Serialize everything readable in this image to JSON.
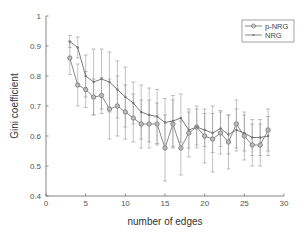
{
  "chart_data": {
    "type": "line",
    "title": "",
    "xlabel": "number of edges",
    "ylabel": "Gini coefficient",
    "xlim": [
      0,
      30
    ],
    "ylim": [
      0.4,
      1
    ],
    "xticks": [
      0,
      5,
      10,
      15,
      20,
      25,
      30
    ],
    "yticks": [
      0.4,
      0.5,
      0.6,
      0.7,
      0.8,
      0.9,
      1
    ],
    "grid": false,
    "legend_position": "upper right",
    "x": [
      3,
      4,
      5,
      6,
      7,
      8,
      9,
      10,
      11,
      12,
      13,
      14,
      15,
      16,
      17,
      18,
      19,
      20,
      21,
      22,
      23,
      24,
      25,
      26,
      27,
      28
    ],
    "series": [
      {
        "name": "p-NRG",
        "marker": "circle",
        "values": [
          0.86,
          0.77,
          0.755,
          0.73,
          0.735,
          0.69,
          0.7,
          0.68,
          0.66,
          0.64,
          0.64,
          0.64,
          0.56,
          0.64,
          0.56,
          0.61,
          0.63,
          0.6,
          0.59,
          0.61,
          0.58,
          0.64,
          0.6,
          0.57,
          0.57,
          0.62
        ],
        "error": [
          0.055,
          0.07,
          0.06,
          0.06,
          0.06,
          0.1,
          0.1,
          0.09,
          0.08,
          0.08,
          0.08,
          0.07,
          0.11,
          0.08,
          0.09,
          0.08,
          0.07,
          0.09,
          0.11,
          0.07,
          0.09,
          0.08,
          0.08,
          0.07,
          0.07,
          0.07
        ]
      },
      {
        "name": "NRG",
        "marker": "dot",
        "values": [
          0.915,
          0.895,
          0.8,
          0.78,
          0.79,
          0.78,
          0.755,
          0.73,
          0.71,
          0.68,
          0.67,
          0.665,
          0.645,
          0.65,
          0.66,
          0.62,
          0.63,
          0.62,
          0.61,
          0.625,
          0.605,
          0.62,
          0.61,
          0.595,
          0.595,
          0.6
        ],
        "error": [
          0.02,
          0.035,
          0.07,
          0.11,
          0.1,
          0.1,
          0.095,
          0.1,
          0.07,
          0.09,
          0.09,
          0.09,
          0.08,
          0.085,
          0.08,
          0.06,
          0.06,
          0.055,
          0.065,
          0.06,
          0.065,
          0.07,
          0.06,
          0.06,
          0.06,
          0.065
        ]
      }
    ]
  },
  "legend": {
    "items": [
      "p-NRG",
      "NRG"
    ]
  },
  "axes": {
    "xlabel": "number of edges",
    "ylabel": "Gini coefficient",
    "xtick_labels": [
      "0",
      "5",
      "10",
      "15",
      "20",
      "25",
      "30"
    ],
    "ytick_labels": [
      "0.4",
      "0.5",
      "0.6",
      "0.7",
      "0.8",
      "0.9",
      "1"
    ]
  }
}
